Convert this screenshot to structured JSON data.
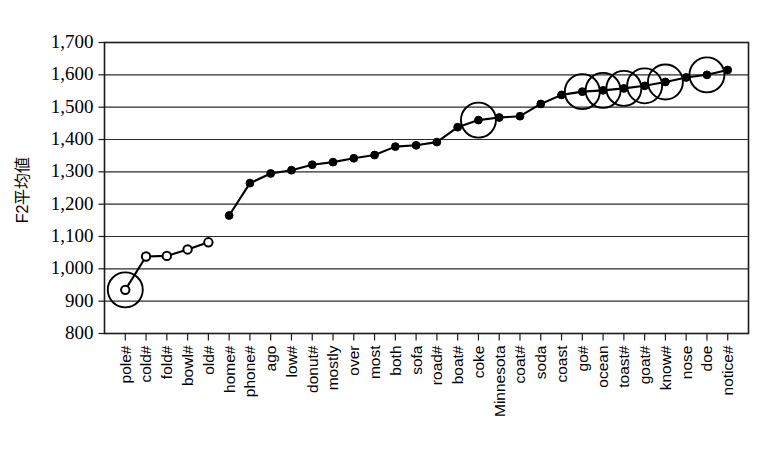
{
  "chart_data": {
    "type": "line",
    "title": "",
    "subtitle": "",
    "xlabel": "",
    "ylabel": "F2平均値",
    "ylim": [
      800,
      1700
    ],
    "y_ticks": [
      "800",
      "900",
      "1,000",
      "1,100",
      "1,200",
      "1,300",
      "1,400",
      "1,500",
      "1,600",
      "1,700"
    ],
    "y_tick_values": [
      800,
      900,
      1000,
      1100,
      1200,
      1300,
      1400,
      1500,
      1600,
      1700
    ],
    "grid": "horizontal",
    "legend": "none",
    "categories": [
      "pole#",
      "cold#",
      "fold#",
      "bowl#",
      "old#",
      "home#",
      "phone#",
      "ago",
      "low#",
      "donut#",
      "mostly",
      "over",
      "most",
      "both",
      "sofa",
      "road#",
      "boat#",
      "coke",
      "Minnesota",
      "coat#",
      "soda",
      "coast",
      "go#",
      "ocean",
      "toast#",
      "goat#",
      "know#",
      "nose",
      "doe",
      "notice#"
    ],
    "values": [
      935,
      1038,
      1040,
      1060,
      1082,
      1165,
      1265,
      1295,
      1305,
      1322,
      1330,
      1342,
      1352,
      1378,
      1382,
      1392,
      1438,
      1460,
      1468,
      1472,
      1510,
      1538,
      1548,
      1552,
      1558,
      1566,
      1578,
      1592,
      1600,
      1615
    ],
    "marker_styles": [
      "open",
      "open",
      "open",
      "open",
      "open",
      "filled",
      "filled",
      "filled",
      "filled",
      "filled",
      "filled",
      "filled",
      "filled",
      "filled",
      "filled",
      "filled",
      "filled",
      "filled",
      "filled",
      "filled",
      "filled",
      "filled",
      "filled",
      "filled",
      "filled",
      "filled",
      "filled",
      "filled",
      "filled",
      "filled"
    ],
    "annotated_indices": [
      0,
      17,
      22,
      23,
      24,
      25,
      26,
      28
    ],
    "series_break_after_index": 4,
    "colors": {
      "line": "#000000",
      "marker": "#000000",
      "grid": "#2b2b2b",
      "axis": "#1a1a1a",
      "background": "#ffffff",
      "annotation": "#000000"
    }
  }
}
